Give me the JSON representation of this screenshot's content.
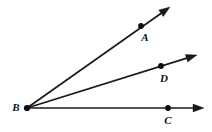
{
  "figure": {
    "type": "geometry-diagram",
    "width": 212,
    "height": 132,
    "background_color": "#ffffff",
    "stroke_color": "#1a1a1a",
    "label_color": "#111111"
  },
  "vertex": {
    "name": "B",
    "label": "B",
    "x": 27,
    "y": 108,
    "label_x": 16,
    "label_y": 108,
    "dot_radius": 3.1
  },
  "rays": [
    {
      "id": "ray-ba",
      "name": "ray-BA",
      "label": "A",
      "from_x": 27,
      "from_y": 108,
      "to_x": 170,
      "to_y": 7,
      "point_x": 141,
      "point_y": 26,
      "label_x": 145,
      "label_y": 38,
      "dot_radius": 2.9,
      "arrow_size": 11
    },
    {
      "id": "ray-bd",
      "name": "ray-BD",
      "label": "D",
      "from_x": 27,
      "from_y": 108,
      "to_x": 197,
      "to_y": 55,
      "point_x": 161,
      "point_y": 66,
      "label_x": 164,
      "label_y": 79,
      "dot_radius": 2.9,
      "arrow_size": 11
    },
    {
      "id": "ray-bc",
      "name": "ray-BC",
      "label": "C",
      "from_x": 27,
      "from_y": 108,
      "to_x": 204,
      "to_y": 108,
      "point_x": 168,
      "point_y": 108,
      "label_x": 168,
      "label_y": 121,
      "dot_radius": 2.9,
      "arrow_size": 11
    }
  ]
}
